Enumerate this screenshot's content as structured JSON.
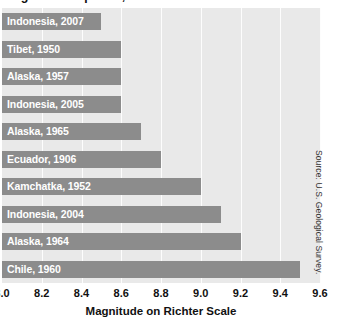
{
  "chart_data": {
    "type": "bar",
    "orientation": "horizontal",
    "title": "Largest Earthquakes, 1900-2008",
    "xlabel": "Magnitude on Richter Scale",
    "ylabel": "",
    "xlim": [
      8.0,
      9.6
    ],
    "xticks": [
      "8.0",
      "8.2",
      "8.4",
      "8.6",
      "8.8",
      "9.0",
      "9.2",
      "9.4",
      "9.6"
    ],
    "xtick_values": [
      8.0,
      8.2,
      8.4,
      8.6,
      8.8,
      9.0,
      9.2,
      9.4,
      9.6
    ],
    "grid": "vertical-only",
    "legend": "none",
    "categories": [
      "Indonesia, 2007",
      "Tibet, 1950",
      "Alaska, 1957",
      "Indonesia, 2005",
      "Alaska, 1965",
      "Ecuador, 1906",
      "Kamchatka, 1952",
      "Indonesia, 2004",
      "Alaska, 1964",
      "Chile, 1960"
    ],
    "values": [
      8.5,
      8.6,
      8.6,
      8.6,
      8.7,
      8.8,
      9.0,
      9.1,
      9.2,
      9.5
    ],
    "bar_color": "#8c8c8c",
    "plot_background": "#e9e9e9",
    "gridline_color": "#fdfdfd",
    "label_color": "#ffffff",
    "annotations": [
      "Source: U.S. Geological Survey."
    ]
  },
  "source": {
    "text": "Source: U.S. Geological Survey."
  }
}
